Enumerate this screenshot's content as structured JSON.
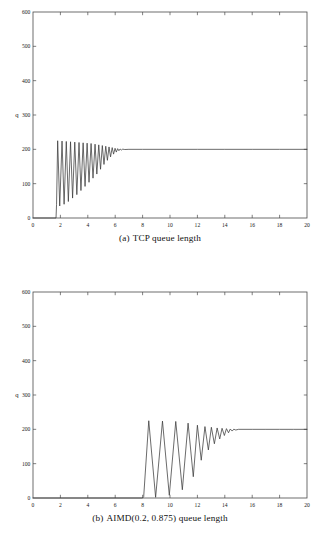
{
  "page": {
    "background": "#ffffff",
    "axis_color": "#4a4a4a",
    "curve_color": "#3a3a3a"
  },
  "figures": [
    {
      "id": "figure-a",
      "caption_tag": "(a)",
      "caption_text": "TCP queue length",
      "caption_full": "(a)  TCP queue length"
    },
    {
      "id": "figure-b",
      "caption_tag": "(b)",
      "caption_text": "AIMD(0.2, 0.875) queue length",
      "caption_full": "(b)  AIMD(0.2, 0.875) queue length"
    }
  ],
  "chart_data": [
    {
      "type": "line",
      "title": "(a) TCP queue length",
      "xlabel": "t",
      "ylabel": "q",
      "xlim": [
        0,
        20
      ],
      "ylim": [
        0,
        600
      ],
      "xticks": [
        0,
        2,
        4,
        6,
        8,
        10,
        12,
        14,
        16,
        18,
        20
      ],
      "yticks": [
        0,
        100,
        200,
        300,
        400,
        500,
        600
      ],
      "xtick_labels": [
        "0",
        "2",
        "4",
        "6",
        "8",
        "10",
        "12",
        "14",
        "16",
        "18",
        "20"
      ],
      "ytick_labels": [
        "0",
        "100",
        "200",
        "300",
        "400",
        "500",
        "600"
      ],
      "grid": false,
      "legend": null,
      "series": [
        {
          "name": "TCP queue length",
          "color": "#3a3a3a",
          "description": "Zero until t=1.70, then sharp damped sawtooth oscillations peaking near 225 with troughs rising from 35 to 190, settling to steady state 200 after t=6.0",
          "points": [
            [
              0.0,
              0
            ],
            [
              1.68,
              0
            ],
            [
              1.72,
              40
            ],
            [
              1.8,
              225
            ],
            [
              1.95,
              35
            ],
            [
              2.12,
              224
            ],
            [
              2.27,
              40
            ],
            [
              2.43,
              223
            ],
            [
              2.58,
              48
            ],
            [
              2.74,
              222
            ],
            [
              2.89,
              58
            ],
            [
              3.05,
              221
            ],
            [
              3.2,
              68
            ],
            [
              3.36,
              220
            ],
            [
              3.5,
              80
            ],
            [
              3.66,
              219
            ],
            [
              3.8,
              92
            ],
            [
              3.95,
              218
            ],
            [
              4.09,
              104
            ],
            [
              4.24,
              217
            ],
            [
              4.38,
              116
            ],
            [
              4.53,
              215
            ],
            [
              4.66,
              128
            ],
            [
              4.8,
              213
            ],
            [
              4.93,
              142
            ],
            [
              5.06,
              211
            ],
            [
              5.18,
              156
            ],
            [
              5.31,
              209
            ],
            [
              5.43,
              168
            ],
            [
              5.55,
              207
            ],
            [
              5.66,
              178
            ],
            [
              5.78,
              205
            ],
            [
              5.88,
              186
            ],
            [
              5.99,
              203
            ],
            [
              6.08,
              192
            ],
            [
              6.18,
              202
            ],
            [
              6.27,
              196
            ],
            [
              6.36,
              201
            ],
            [
              6.45,
              198
            ],
            [
              6.55,
              200.5
            ],
            [
              6.7,
              199.5
            ],
            [
              7.0,
              200
            ],
            [
              8.0,
              200
            ],
            [
              10.0,
              200
            ],
            [
              12.0,
              200
            ],
            [
              14.0,
              200
            ],
            [
              16.0,
              200
            ],
            [
              18.0,
              200
            ],
            [
              20.0,
              200
            ]
          ]
        }
      ]
    },
    {
      "type": "line",
      "title": "(b) AIMD(0.2, 0.875) queue length",
      "xlabel": "t",
      "ylabel": "q",
      "xlim": [
        0,
        20
      ],
      "ylim": [
        0,
        600
      ],
      "xticks": [
        0,
        2,
        4,
        6,
        8,
        10,
        12,
        14,
        16,
        18,
        20
      ],
      "yticks": [
        0,
        100,
        200,
        300,
        400,
        500,
        600
      ],
      "xtick_labels": [
        "0",
        "2",
        "4",
        "6",
        "8",
        "10",
        "12",
        "14",
        "16",
        "18",
        "20"
      ],
      "ytick_labels": [
        "0",
        "100",
        "200",
        "300",
        "400",
        "500",
        "600"
      ],
      "grid": false,
      "legend": null,
      "series": [
        {
          "name": "AIMD(0.2, 0.875) queue length",
          "color": "#3a3a3a",
          "description": "Zero until t=8.05, then smooth damped sinusoidal oscillations peaking near 225 with troughs rising from 2 to 185, settling to steady state 200 after t=14.2",
          "points": [
            [
              0.0,
              0
            ],
            [
              4.0,
              0
            ],
            [
              8.0,
              0
            ],
            [
              8.08,
              4
            ],
            [
              8.45,
              225
            ],
            [
              8.95,
              2
            ],
            [
              9.45,
              224
            ],
            [
              9.95,
              8
            ],
            [
              10.42,
              223
            ],
            [
              10.9,
              24
            ],
            [
              11.32,
              218
            ],
            [
              11.7,
              62
            ],
            [
              12.0,
              212
            ],
            [
              12.28,
              110
            ],
            [
              12.55,
              208
            ],
            [
              12.8,
              140
            ],
            [
              13.02,
              206
            ],
            [
              13.24,
              158
            ],
            [
              13.44,
              204
            ],
            [
              13.63,
              172
            ],
            [
              13.8,
              203
            ],
            [
              13.97,
              182
            ],
            [
              14.12,
              202
            ],
            [
              14.27,
              190
            ],
            [
              14.4,
              201
            ],
            [
              14.54,
              195
            ],
            [
              14.66,
              200.5
            ],
            [
              14.8,
              198
            ],
            [
              15.0,
              200
            ],
            [
              16.0,
              200
            ],
            [
              17.0,
              200
            ],
            [
              18.0,
              200
            ],
            [
              19.0,
              200
            ],
            [
              20.0,
              200
            ]
          ]
        }
      ]
    }
  ]
}
